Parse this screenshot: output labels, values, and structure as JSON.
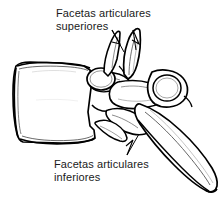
{
  "figure": {
    "kind": "anatomical-line-drawing",
    "background_color": "#ffffff",
    "line_color": "#000000",
    "text_color": "#1a1a1a",
    "width": 223,
    "height": 215
  },
  "labels": {
    "superior": {
      "line1": "Facetas articulares",
      "line2": "superiores"
    },
    "inferior": {
      "line1": "Facetas articulares",
      "line2": "inferiores"
    }
  },
  "caption": {
    "text": ""
  },
  "parts": {
    "vertebral_body": "vertebral-body",
    "superior_articular_process": "superior-articular-process",
    "superior_articular_facet": "superior-articular-facet",
    "inferior_articular_facet": "inferior-articular-facet",
    "transverse_process": "transverse-process",
    "pedicle": "pedicle",
    "spinous_process": "spinous-process"
  }
}
